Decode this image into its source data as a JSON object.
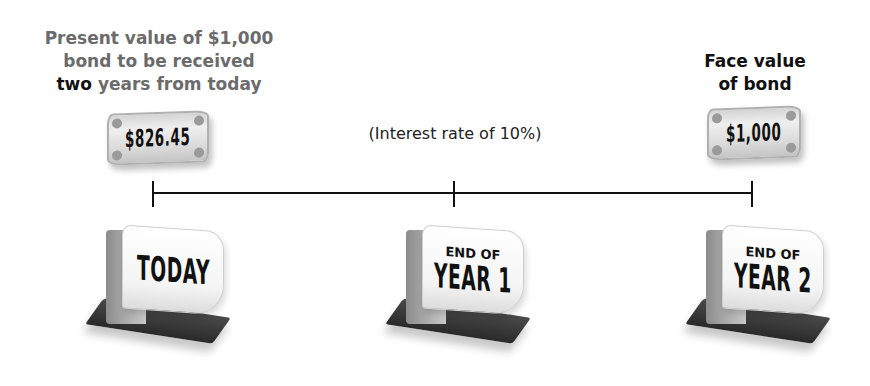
{
  "labels": {
    "present_value": {
      "line1": "Present value of $1,000",
      "line2": "bond to be received",
      "line3_emphasis": "two",
      "line3_rest": " years from today"
    },
    "face_value": {
      "line1": "Face value",
      "line2": "of bond"
    },
    "interest_rate": "(Interest rate of 10%)"
  },
  "bills": [
    {
      "amount": "$826.45"
    },
    {
      "amount": "$1,000"
    }
  ],
  "timeline": {
    "points": [
      {
        "top": "",
        "bottom": "TODAY"
      },
      {
        "top": "END OF",
        "bottom": "YEAR 1"
      },
      {
        "top": "END OF",
        "bottom": "YEAR 2"
      }
    ]
  },
  "colors": {
    "heading_gray": "#6b6b6b",
    "text_dark": "#111111",
    "line": "#111111"
  }
}
